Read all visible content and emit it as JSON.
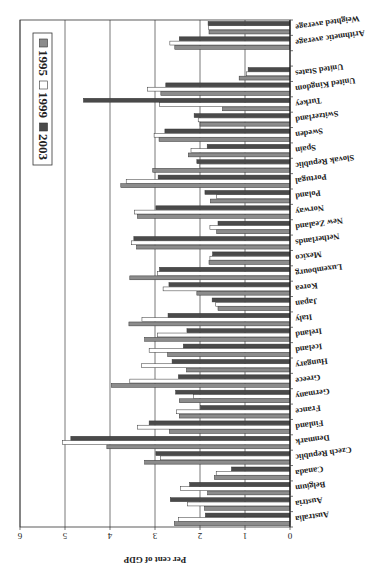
{
  "chart_data": {
    "type": "bar",
    "orientation": "horizontal",
    "rendered_rotation_deg": 180,
    "title": "",
    "xlabel": "Per cent of GDP",
    "ylabel": "",
    "xlim": [
      0,
      6
    ],
    "xticks": [
      "0",
      "1",
      "2",
      "3",
      "4",
      "5",
      "6"
    ],
    "grid": true,
    "legend_position": "lower right (in upright orientation)",
    "colors": {
      "1995": "#8c8c8c",
      "1999": "#ffffff",
      "2003": "#4a4a4a"
    },
    "categories": [
      "Australia",
      "Austria",
      "Belgium",
      "Canada",
      "Czech Republic",
      "Denmark",
      "Finland",
      "France",
      "Germany",
      "Greece",
      "Hungary",
      "Iceland",
      "Ireland",
      "Italy",
      "Japan",
      "Korea",
      "Luxembourg",
      "Mexico",
      "Netherlands",
      "New Zealand",
      "Norway",
      "Poland",
      "Portugal",
      "Slovak Republic",
      "Spain",
      "Sweden",
      "Switzerland",
      "Turkey",
      "United Kingdom",
      "United States",
      "",
      "Arithmetic average",
      "Weighted average"
    ],
    "series": [
      {
        "name": "1995",
        "values": [
          2.57,
          1.9,
          1.83,
          1.68,
          3.23,
          4.07,
          2.68,
          2.46,
          2.46,
          3.97,
          2.3,
          2.72,
          3.23,
          3.58,
          1.6,
          2.07,
          3.56,
          1.8,
          3.41,
          1.63,
          3.39,
          1.77,
          3.76,
          3.05,
          2.26,
          2.91,
          2.0,
          1.5,
          2.87,
          1.13,
          null,
          2.56,
          1.8
        ]
      },
      {
        "name": "1999",
        "values": [
          2.48,
          2.28,
          2.43,
          1.64,
          2.88,
          5.06,
          3.39,
          2.52,
          2.15,
          3.56,
          3.3,
          3.13,
          2.94,
          3.29,
          1.65,
          2.82,
          2.94,
          1.78,
          3.52,
          1.78,
          3.46,
          1.63,
          3.64,
          2.0,
          2.2,
          3.02,
          2.04,
          2.9,
          3.17,
          0.97,
          null,
          2.67,
          1.81
        ]
      },
      {
        "name": "2003",
        "values": [
          1.88,
          2.66,
          2.23,
          1.3,
          2.98,
          4.87,
          3.13,
          1.99,
          2.54,
          2.48,
          2.62,
          2.37,
          2.29,
          2.71,
          1.73,
          2.69,
          2.9,
          1.72,
          3.47,
          1.6,
          2.98,
          1.89,
          2.93,
          2.07,
          1.84,
          2.78,
          2.13,
          4.59,
          2.76,
          0.93,
          null,
          2.46,
          1.82
        ]
      }
    ]
  },
  "legend": {
    "items": [
      "1995",
      "1999",
      "2003"
    ]
  },
  "axis": {
    "title": "Per cent of GDP"
  }
}
